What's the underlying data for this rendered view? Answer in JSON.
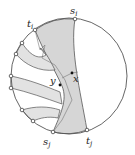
{
  "diagram": {
    "type": "geometric-disk-diagram",
    "colors": {
      "stroke": "#555555",
      "fill": "#d8d8d8",
      "fill_light": "#e6e6e6",
      "background": "#ffffff"
    },
    "labels": {
      "s_i": {
        "base": "s",
        "sub": "i"
      },
      "t_i": {
        "base": "t",
        "sub": "i"
      },
      "s_j": {
        "base": "s",
        "sub": "j"
      },
      "t_j": {
        "base": "t",
        "sub": "j"
      },
      "x": {
        "base": "x",
        "sub": ""
      },
      "y": {
        "base": "y",
        "sub": ""
      }
    },
    "boundary_points": 9,
    "interior_points": [
      "x",
      "y"
    ]
  }
}
